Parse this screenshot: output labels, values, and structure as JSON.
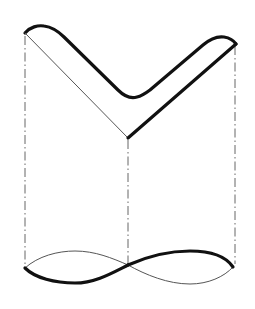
{
  "figure": {
    "colors": {
      "stroke_thick": "#111111",
      "stroke_thin": "#555555",
      "projection_line": "#666666",
      "background": "#ffffff"
    },
    "projection_lines": [
      {
        "name": "left",
        "x": 25,
        "y1": 33,
        "y2": 268
      },
      {
        "name": "middle",
        "x": 128,
        "y1": 138,
        "y2": 265
      },
      {
        "name": "right",
        "x": 235,
        "y1": 45,
        "y2": 266
      }
    ],
    "labels": []
  }
}
